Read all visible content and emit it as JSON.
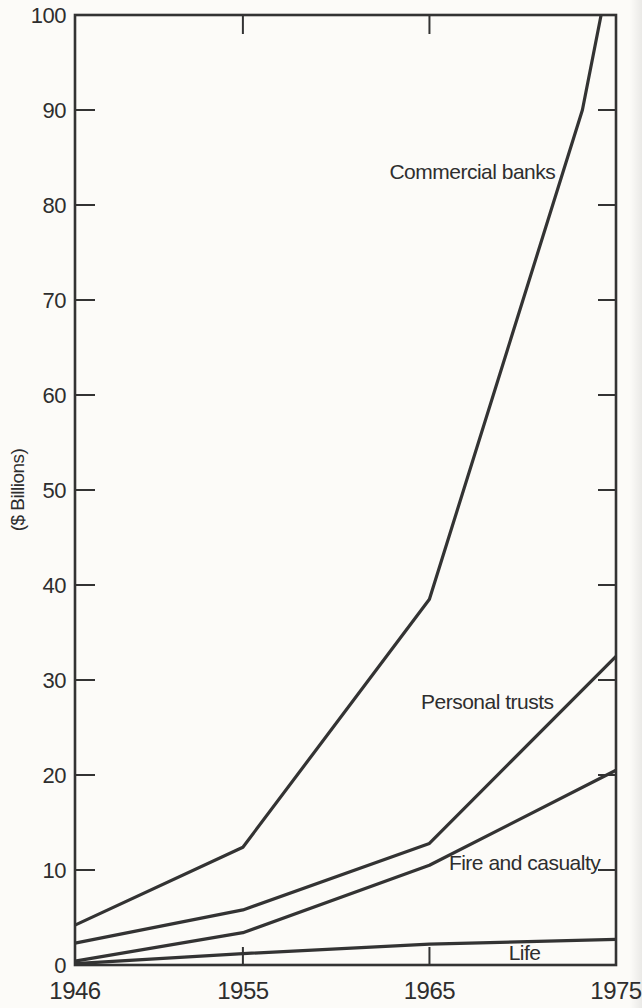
{
  "figure": {
    "background": "#fcfbf8",
    "ink": "#333333",
    "text_color": "#2e2e2e"
  },
  "chart_data": {
    "type": "line",
    "title": "",
    "xlabel": "",
    "ylabel": "($ Billions)",
    "xlim": [
      1946,
      1975
    ],
    "ylim": [
      0,
      100
    ],
    "grid": false,
    "frame": "box",
    "legend_position": "inline-labels",
    "x_tick_years": [
      1946,
      1955,
      1965,
      1975
    ],
    "x_tick_labels": [
      "1946",
      "1955",
      "1965",
      "1975"
    ],
    "x_inner_tick_years": [
      1955,
      1965
    ],
    "y_ticks": [
      0,
      10,
      20,
      30,
      40,
      50,
      60,
      70,
      80,
      90,
      100
    ],
    "y_tick_labels": [
      "0",
      "10",
      "20",
      "30",
      "40",
      "50",
      "60",
      "70",
      "80",
      "90",
      "100"
    ],
    "y_inner_ticks": [
      10,
      20,
      30,
      40,
      50,
      60,
      70,
      80,
      90
    ],
    "series": [
      {
        "name": "Commercial banks",
        "points": [
          [
            1946,
            4.2
          ],
          [
            1955,
            12.4
          ],
          [
            1965,
            38.5
          ],
          [
            1973.2,
            90
          ],
          [
            1974.2,
            100
          ]
        ],
        "clipped_at_top": true,
        "label_at": {
          "year": 1967.3,
          "value": 83.5
        }
      },
      {
        "name": "Personal trusts",
        "points": [
          [
            1946,
            2.3
          ],
          [
            1955,
            5.8
          ],
          [
            1965,
            12.8
          ],
          [
            1975,
            32.5
          ]
        ],
        "clipped_at_top": false,
        "label_at": {
          "year": 1968.1,
          "value": 27.7
        }
      },
      {
        "name": "Fire and casualty",
        "points": [
          [
            1946,
            0.4
          ],
          [
            1955,
            3.4
          ],
          [
            1965,
            10.5
          ],
          [
            1975,
            20.5
          ]
        ],
        "clipped_at_top": false,
        "label_at": {
          "year": 1970.1,
          "value": 10.8
        }
      },
      {
        "name": "Life",
        "points": [
          [
            1946,
            0.15
          ],
          [
            1955,
            1.2
          ],
          [
            1965,
            2.2
          ],
          [
            1975,
            2.7
          ]
        ],
        "clipped_at_top": false,
        "label_at": {
          "year": 1970.1,
          "value": 1.3
        }
      }
    ]
  }
}
